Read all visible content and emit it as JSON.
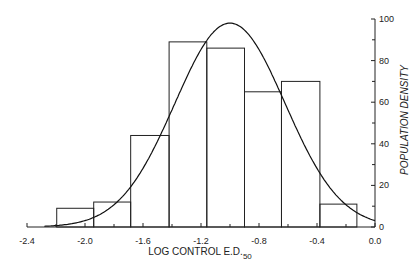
{
  "chart_data": {
    "type": "bar",
    "title": "",
    "xlabel": "LOG CONTROL E.D.",
    "xlabel_subscript": "50",
    "ylabel": "POPULATION DENSITY",
    "xlim": [
      -2.4,
      0.0
    ],
    "ylim": [
      0,
      100
    ],
    "x_ticks": [
      "-2.4",
      "-2.0",
      "-1.6",
      "-1.2",
      "-0.8",
      "-0.4",
      "0.0"
    ],
    "x_tick_values": [
      -2.4,
      -2.0,
      -1.6,
      -1.2,
      -0.8,
      -0.4,
      0.0
    ],
    "y_ticks": [
      "0",
      "20",
      "40",
      "60",
      "80",
      "100"
    ],
    "y_tick_values": [
      0,
      20,
      40,
      60,
      80,
      100
    ],
    "y_axis_position": "right",
    "grid": false,
    "legend": null,
    "histogram": {
      "bin_edges": [
        -2.195,
        -1.94,
        -1.685,
        -1.42,
        -1.16,
        -0.9,
        -0.645,
        -0.38,
        -0.125
      ],
      "values": [
        9,
        12,
        44,
        89,
        86,
        65,
        70,
        11
      ]
    },
    "fitted_curve": {
      "type": "normal",
      "mean": -1.0,
      "peak": 98,
      "sd": 0.38
    }
  }
}
